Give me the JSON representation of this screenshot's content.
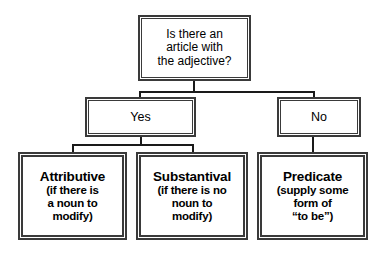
{
  "diagram": {
    "type": "decision-tree",
    "title_text": "",
    "background_color": "#ffffff",
    "line_color": "#1a1a1a",
    "box_border_color": "#3a3a3a",
    "box_fill_color": "#ffffff",
    "text_color": "#000000",
    "nodes": {
      "question": {
        "lines": [
          "Is there an",
          "article with",
          "the adjective?"
        ]
      },
      "yes": {
        "label": "Yes"
      },
      "no": {
        "label": "No"
      },
      "attributive": {
        "title": "Attributive",
        "sub_lines": [
          "(if there is",
          "a noun to",
          "modify)"
        ]
      },
      "substantival": {
        "title": "Substantival",
        "sub_lines": [
          "(if there is no",
          "noun to",
          "modify)"
        ]
      },
      "predicate": {
        "title": "Predicate",
        "sub_lines": [
          "(supply some",
          "form of",
          "“to be”)"
        ]
      }
    },
    "edges": [
      {
        "from": "question",
        "to": "yes"
      },
      {
        "from": "question",
        "to": "no"
      },
      {
        "from": "yes",
        "to": "attributive"
      },
      {
        "from": "yes",
        "to": "substantival"
      },
      {
        "from": "no",
        "to": "predicate"
      }
    ]
  }
}
